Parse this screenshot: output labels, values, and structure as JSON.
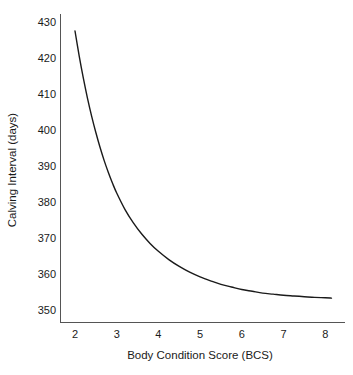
{
  "chart_data": {
    "type": "line",
    "title": "",
    "xlabel": "Body Condition Score (BCS)",
    "ylabel": "Calving Interval (days)",
    "xlim": [
      1.6,
      8.4
    ],
    "ylim": [
      346,
      432
    ],
    "xticks": [
      2,
      3,
      4,
      5,
      6,
      7,
      8
    ],
    "xtick_labels": [
      "2",
      "3",
      "4",
      "5",
      "6",
      "7",
      "8"
    ],
    "yticks": [
      350,
      360,
      370,
      380,
      390,
      400,
      410,
      420,
      430
    ],
    "ytick_labels": [
      "350",
      "360",
      "370",
      "380",
      "390",
      "400",
      "410",
      "420",
      "430"
    ],
    "grid": false,
    "legend": null,
    "line_color": "#1a1a1a",
    "axis_color": "#555555",
    "series": [
      {
        "name": "Calving Interval",
        "x": [
          2.0,
          2.1,
          2.2,
          2.3,
          2.4,
          2.5,
          2.6,
          2.7,
          2.8,
          2.9,
          3.0,
          3.2,
          3.4,
          3.6,
          3.8,
          4.0,
          4.25,
          4.5,
          4.75,
          5.0,
          5.25,
          5.5,
          5.75,
          6.0,
          6.25,
          6.5,
          6.75,
          7.0,
          7.25,
          7.5,
          7.75,
          8.0,
          8.15
        ],
        "values": [
          427.5,
          420.6,
          414.4,
          408.8,
          403.8,
          399.3,
          395.2,
          391.5,
          388.2,
          385.2,
          382.5,
          377.9,
          374.2,
          371.1,
          368.5,
          366.3,
          364.0,
          362.1,
          360.5,
          359.2,
          358.1,
          357.1,
          356.4,
          355.7,
          355.2,
          354.7,
          354.4,
          354.1,
          353.9,
          353.7,
          353.5,
          353.4,
          353.3
        ]
      }
    ],
    "annotations": []
  },
  "figure": {
    "background_color": "#ffffff",
    "font_size": "11px"
  }
}
